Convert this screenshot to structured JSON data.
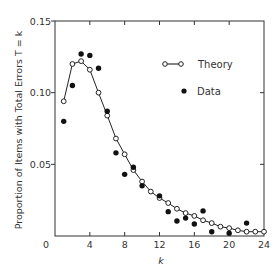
{
  "chart_data": {
    "type": "scatter",
    "title": "",
    "xlabel": "k",
    "ylabel": "Proportion of Items with Total Errors T = k",
    "xlim": [
      0,
      24
    ],
    "ylim": [
      0,
      0.15
    ],
    "grid": false,
    "legend_position": "upper right",
    "x_ticks": [
      0,
      4,
      8,
      12,
      16,
      20,
      24
    ],
    "x_tick_labels": [
      "0",
      "4",
      "8",
      "12",
      "16",
      "20",
      "24"
    ],
    "y_ticks": [
      0.05,
      0.1,
      0.15
    ],
    "y_tick_labels": [
      "0.05",
      "0.10",
      "0.15"
    ],
    "series": [
      {
        "name": "Theory",
        "style": "line with open circles",
        "x": [
          1,
          2,
          3,
          4,
          5,
          6,
          7,
          8,
          9,
          10,
          11,
          12,
          13,
          14,
          15,
          16,
          17,
          18,
          19,
          20,
          21,
          22,
          23,
          24
        ],
        "values": [
          0.094,
          0.12,
          0.122,
          0.116,
          0.1,
          0.084,
          0.068,
          0.057,
          0.046,
          0.038,
          0.031,
          0.0265,
          0.023,
          0.019,
          0.016,
          0.014,
          0.011,
          0.009,
          0.0065,
          0.0055,
          0.004,
          0.003,
          0.003,
          0.003
        ]
      },
      {
        "name": "Data",
        "style": "filled circles",
        "x": [
          1,
          2,
          3,
          4,
          5,
          6,
          7,
          8,
          9,
          10,
          12,
          13,
          14,
          15,
          16,
          17,
          18,
          20,
          22
        ],
        "values": [
          0.08,
          0.105,
          0.127,
          0.126,
          0.117,
          0.087,
          0.058,
          0.043,
          0.048,
          0.035,
          0.028,
          0.017,
          0.0105,
          0.0125,
          0.0084,
          0.0175,
          0.003,
          0.002,
          0.009
        ]
      }
    ]
  },
  "legend": {
    "theory_label": "Theory",
    "data_label": "Data"
  },
  "axes": {
    "x_label": "k",
    "y_label": "Proportion of Items with Total Errors T = k",
    "x_origin_label": "0"
  }
}
